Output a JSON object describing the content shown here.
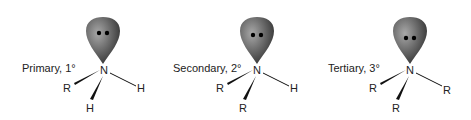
{
  "diagram": {
    "type": "amine-classification",
    "colors": {
      "lobe_dark": "#3a3a3a",
      "lobe_light": "#9a9a9a",
      "bond": "#111111",
      "text": "#222222"
    },
    "panels": [
      {
        "label": "Primary, 1°",
        "center_atom": "N",
        "lone_pair": "••",
        "substituents": {
          "left": "R",
          "right": "H",
          "bottom": "H"
        }
      },
      {
        "label": "Secondary, 2°",
        "center_atom": "N",
        "lone_pair": "••",
        "substituents": {
          "left": "R",
          "right": "H",
          "bottom": "R"
        }
      },
      {
        "label": "Tertiary, 3°",
        "center_atom": "N",
        "lone_pair": "••",
        "substituents": {
          "left": "R",
          "right": "R",
          "bottom": "R"
        }
      }
    ]
  }
}
